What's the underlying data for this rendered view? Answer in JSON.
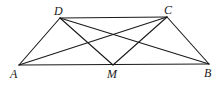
{
  "figure": {
    "points": {
      "A": {
        "label": "A"
      },
      "B": {
        "label": "B"
      },
      "C": {
        "label": "C"
      },
      "D": {
        "label": "D"
      },
      "M": {
        "label": "M"
      }
    },
    "segments": [
      [
        "A",
        "B"
      ],
      [
        "D",
        "C"
      ],
      [
        "A",
        "D"
      ],
      [
        "B",
        "C"
      ],
      [
        "A",
        "C"
      ],
      [
        "D",
        "B"
      ],
      [
        "D",
        "M"
      ],
      [
        "C",
        "M"
      ]
    ]
  }
}
